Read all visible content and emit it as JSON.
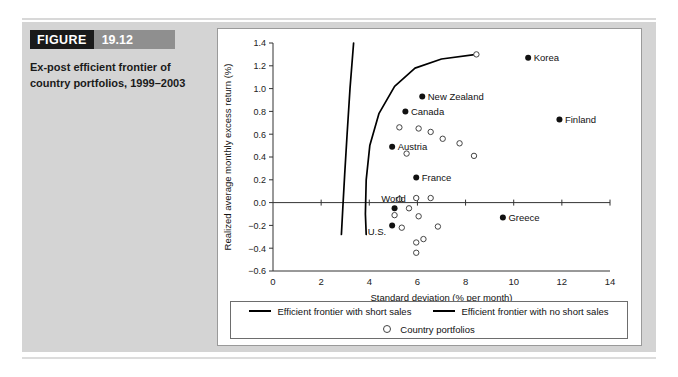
{
  "figure": {
    "tag_word": "FIGURE",
    "tag_number": "19.12",
    "description": "Ex-post efficient frontier of country portfolios, 1999–2003"
  },
  "legend": {
    "short_sales_label": "Efficient frontier with short sales",
    "no_short_sales_label": "Efficient frontier with no short sales",
    "country_portfolios_label": "Country portfolios"
  },
  "chart_data": {
    "type": "scatter",
    "title": "",
    "xlabel": "Standard deviation (% per month)",
    "ylabel": "Realized average monthly excess return (%)",
    "xlim": [
      0,
      14
    ],
    "ylim": [
      -0.6,
      1.4
    ],
    "xticks": [
      0,
      2,
      4,
      6,
      8,
      10,
      12,
      14
    ],
    "xtick_labels": [
      "0",
      "2",
      "4",
      "6",
      "8",
      "10",
      "12",
      "14"
    ],
    "yticks": [
      -0.6,
      -0.4,
      -0.2,
      0.0,
      0.2,
      0.4,
      0.6,
      0.8,
      1.0,
      1.2,
      1.4
    ],
    "ytick_labels": [
      "−0.6",
      "−0.4",
      "−0.2",
      "0.0",
      "0.2",
      "0.4",
      "0.6",
      "0.8",
      "1.0",
      "1.2",
      "1.4"
    ],
    "grid": false,
    "legend_position": "bottom",
    "labeled_points": [
      {
        "name": "Korea",
        "x": 10.6,
        "y": 1.27,
        "label_side": "right"
      },
      {
        "name": "New Zealand",
        "x": 6.2,
        "y": 0.93,
        "label_side": "right"
      },
      {
        "name": "Finland",
        "x": 11.9,
        "y": 0.73,
        "label_side": "right"
      },
      {
        "name": "Canada",
        "x": 5.5,
        "y": 0.8,
        "label_side": "right"
      },
      {
        "name": "Austria",
        "x": 4.95,
        "y": 0.49,
        "label_side": "right"
      },
      {
        "name": "France",
        "x": 5.95,
        "y": 0.22,
        "label_side": "right"
      },
      {
        "name": "World",
        "x": 5.05,
        "y": -0.05,
        "label_side": "above"
      },
      {
        "name": "Greece",
        "x": 9.55,
        "y": -0.13,
        "label_side": "right"
      },
      {
        "name": "U.S.",
        "x": 4.95,
        "y": -0.2,
        "label_side": "below-left"
      }
    ],
    "country_portfolios": [
      {
        "x": 8.45,
        "y": 1.3
      },
      {
        "x": 5.25,
        "y": 0.66
      },
      {
        "x": 6.05,
        "y": 0.65
      },
      {
        "x": 6.55,
        "y": 0.62
      },
      {
        "x": 7.05,
        "y": 0.56
      },
      {
        "x": 7.75,
        "y": 0.52
      },
      {
        "x": 8.35,
        "y": 0.41
      },
      {
        "x": 5.55,
        "y": 0.43
      },
      {
        "x": 5.25,
        "y": 0.03
      },
      {
        "x": 5.95,
        "y": 0.04
      },
      {
        "x": 6.55,
        "y": 0.04
      },
      {
        "x": 5.65,
        "y": -0.05
      },
      {
        "x": 5.05,
        "y": -0.11
      },
      {
        "x": 5.35,
        "y": -0.22
      },
      {
        "x": 6.05,
        "y": -0.12
      },
      {
        "x": 6.85,
        "y": -0.21
      },
      {
        "x": 5.95,
        "y": -0.35
      },
      {
        "x": 6.25,
        "y": -0.32
      },
      {
        "x": 5.95,
        "y": -0.44
      }
    ],
    "efficient_frontier_short_sales": [
      {
        "x": 3.35,
        "y": 1.4
      },
      {
        "x": 3.2,
        "y": 1.0
      },
      {
        "x": 3.08,
        "y": 0.6
      },
      {
        "x": 2.98,
        "y": 0.25
      },
      {
        "x": 2.9,
        "y": -0.05
      },
      {
        "x": 2.84,
        "y": -0.28
      }
    ],
    "efficient_frontier_no_short_sales": [
      {
        "x": 8.45,
        "y": 1.3
      },
      {
        "x": 7.0,
        "y": 1.26
      },
      {
        "x": 5.9,
        "y": 1.18
      },
      {
        "x": 5.05,
        "y": 1.02
      },
      {
        "x": 4.4,
        "y": 0.78
      },
      {
        "x": 4.02,
        "y": 0.5
      },
      {
        "x": 3.87,
        "y": 0.2
      },
      {
        "x": 3.84,
        "y": -0.1
      },
      {
        "x": 3.87,
        "y": -0.28
      }
    ]
  }
}
